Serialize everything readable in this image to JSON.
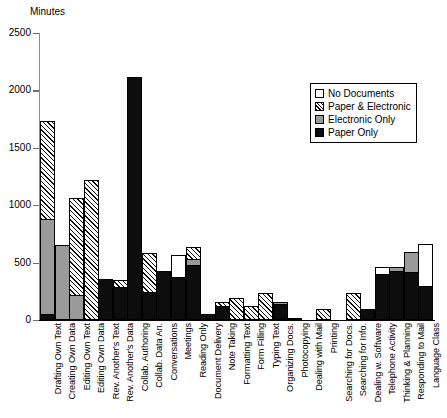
{
  "chart_data": {
    "type": "bar",
    "stacked": true,
    "title": "",
    "xlabel": "",
    "ylabel": "Minutes",
    "ylim": [
      0,
      2500
    ],
    "yticks": [
      0,
      500,
      1000,
      1500,
      2000,
      2500
    ],
    "ytick_labels": [
      "0",
      "500",
      "1000",
      "1500",
      "2000",
      "2500"
    ],
    "grid": false,
    "legend_position": "top-right",
    "legend": [
      "No Documents",
      "Paper & Electronic",
      "Electronic Only",
      "Paper Only"
    ],
    "categories": [
      "Drafting Own Text",
      "Creating Own Data",
      "Editing Own Text",
      "Editing Own Data",
      "Rev. Another's Text",
      "Rev. Another's Data",
      "Collab. Authoring",
      "Collab. Data An.",
      "Conversations",
      "Meetings",
      "Reading Only",
      "Document Delivery",
      "Note Taking",
      "Formatting Text",
      "Form Filling",
      "Typing Text",
      "Organizing Docs.",
      "Photocopying",
      "Dealing with Mail",
      "Printing",
      "Searching for Docs.",
      "Searching for Info.",
      "Dealing w. Software",
      "Telephone Activity",
      "Thinking & Planning",
      "Responding to Mail",
      "Language Class"
    ],
    "series": [
      {
        "name": "Paper Only",
        "color": "#0d0d0d",
        "values": [
          55,
          0,
          0,
          0,
          360,
          285,
          2115,
          240,
          430,
          375,
          480,
          55,
          120,
          0,
          0,
          0,
          140,
          0,
          0,
          0,
          0,
          0,
          95,
          400,
          430,
          415,
          300
        ]
      },
      {
        "name": "Electronic Only",
        "color": "#9a9a9a",
        "values": [
          825,
          650,
          215,
          0,
          0,
          0,
          0,
          0,
          0,
          0,
          55,
          0,
          0,
          0,
          0,
          0,
          20,
          0,
          0,
          0,
          0,
          0,
          0,
          0,
          35,
          180,
          0
        ]
      },
      {
        "name": "Paper & Electronic",
        "color": "#hatch",
        "values": [
          850,
          0,
          845,
          1220,
          0,
          60,
          0,
          345,
          0,
          0,
          105,
          0,
          35,
          190,
          125,
          235,
          0,
          20,
          0,
          95,
          0,
          235,
          0,
          0,
          0,
          0,
          0
        ]
      },
      {
        "name": "No Documents",
        "color": "#ffffff",
        "values": [
          0,
          0,
          0,
          0,
          0,
          0,
          0,
          0,
          0,
          195,
          0,
          0,
          0,
          0,
          0,
          0,
          0,
          0,
          0,
          0,
          0,
          0,
          0,
          60,
          0,
          0,
          360
        ]
      }
    ],
    "bar_totals": [
      1730,
      650,
      1060,
      1220,
      360,
      345,
      2115,
      585,
      430,
      570,
      640,
      55,
      155,
      190,
      125,
      235,
      160,
      20,
      0,
      95,
      0,
      235,
      95,
      460,
      465,
      595,
      660
    ]
  },
  "legend_items": [
    {
      "label": "No Documents",
      "swatch": "none"
    },
    {
      "label": "Paper & Electronic",
      "swatch": "both"
    },
    {
      "label": "Electronic Only",
      "swatch": "electronic"
    },
    {
      "label": "Paper Only",
      "swatch": "paper"
    }
  ]
}
